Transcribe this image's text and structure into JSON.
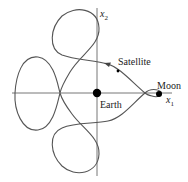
{
  "diagram": {
    "title": "",
    "axes": {
      "x_label": "x",
      "x_sub": "1",
      "y_label": "x",
      "y_sub": "2"
    },
    "bodies": {
      "earth_label": "Earth",
      "moon_label": "Moon",
      "satellite_label": "Satellite"
    },
    "colors": {
      "curve": "#555555",
      "axis": "#666666",
      "body": "#000000"
    }
  }
}
